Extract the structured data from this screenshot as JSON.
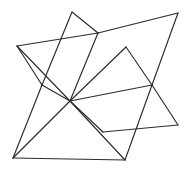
{
  "figure": {
    "title": "Interlocking star polygon line drawing",
    "type": "line-art",
    "width": 189,
    "height": 173,
    "background_color": "#ffffff",
    "stroke_color": "#2b2b2b",
    "stroke_width": 1.15,
    "vertices": {
      "top_peak": [
        72,
        12
      ],
      "top_right": [
        178,
        13
      ],
      "upper_hub": [
        98,
        33
      ],
      "right_notch": [
        126,
        47
      ],
      "left_point": [
        17,
        46
      ],
      "left_notch": [
        42,
        85
      ],
      "center_hub": [
        70,
        101
      ],
      "right_hub": [
        152,
        85
      ],
      "right_point": [
        178,
        125
      ],
      "bottom_notch": [
        125,
        160
      ],
      "bottom_left": [
        13,
        158
      ],
      "mid_lower": [
        103,
        132
      ]
    },
    "edges": [
      {
        "name": "left-point-to-upper-hub",
        "from": "left_point",
        "to": "upper_hub"
      },
      {
        "name": "upper-hub-to-top-peak",
        "from": "upper_hub",
        "to": "top_peak"
      },
      {
        "name": "top-peak-to-left-notch",
        "from": "top_peak",
        "to": "left_notch"
      },
      {
        "name": "upper-hub-to-top-right",
        "from": "upper_hub",
        "to": "top_right"
      },
      {
        "name": "top-right-to-right-hub",
        "from": "top_right",
        "to": "right_hub"
      },
      {
        "name": "upper-hub-to-center-hub",
        "from": "upper_hub",
        "to": "center_hub"
      },
      {
        "name": "center-hub-to-right-notch",
        "from": "center_hub",
        "to": "right_notch"
      },
      {
        "name": "right-notch-to-right-hub",
        "from": "right_notch",
        "to": "right_hub"
      },
      {
        "name": "center-hub-to-right-hub",
        "from": "center_hub",
        "to": "right_hub"
      },
      {
        "name": "right-hub-to-right-point",
        "from": "right_hub",
        "to": "right_point"
      },
      {
        "name": "right-point-to-mid-lower",
        "from": "right_point",
        "to": "mid_lower"
      },
      {
        "name": "mid-lower-to-center-hub",
        "from": "mid_lower",
        "to": "center_hub"
      },
      {
        "name": "left-point-to-left-notch",
        "from": "left_point",
        "to": "left_notch"
      },
      {
        "name": "left-point-to-center-hub",
        "from": "left_point",
        "to": "center_hub"
      },
      {
        "name": "left-notch-to-center-hub",
        "from": "left_notch",
        "to": "center_hub"
      },
      {
        "name": "left-notch-to-bottom-left",
        "from": "left_notch",
        "to": "bottom_left"
      },
      {
        "name": "bottom-left-to-center-hub",
        "from": "bottom_left",
        "to": "center_hub"
      },
      {
        "name": "bottom-left-to-bottom-notch",
        "from": "bottom_left",
        "to": "bottom_notch"
      },
      {
        "name": "center-hub-to-bottom-notch",
        "from": "center_hub",
        "to": "bottom_notch"
      },
      {
        "name": "bottom-notch-to-right-hub",
        "from": "bottom_notch",
        "to": "right_hub"
      }
    ]
  }
}
